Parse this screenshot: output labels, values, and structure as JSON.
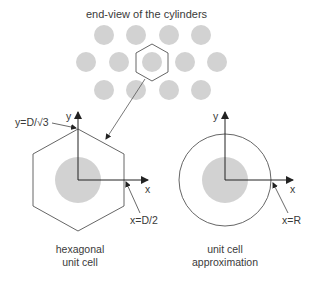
{
  "title": "end-view of the cylinders",
  "hexagonal": {
    "y_axis_label": "y",
    "x_axis_label": "x",
    "y_annotation": "y=D/√3",
    "x_annotation": "x=D/2",
    "caption_line1": "hexagonal",
    "caption_line2": "unit cell"
  },
  "circular": {
    "y_axis_label": "y",
    "x_axis_label": "x",
    "x_annotation": "x=R",
    "caption_line1": "unit cell",
    "caption_line2": "approximation"
  },
  "colors": {
    "cylinder_fill": "#d2d2d2",
    "line": "#555555",
    "axis": "#222222"
  }
}
